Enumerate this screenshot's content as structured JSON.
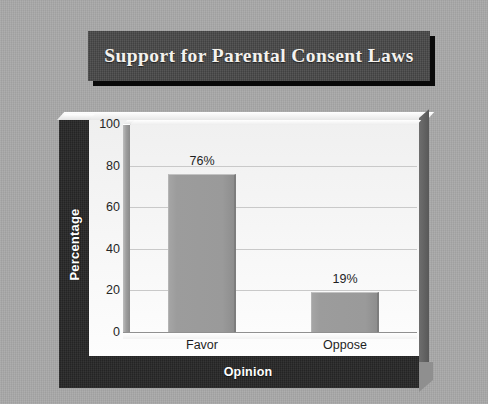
{
  "slide": {
    "title": "Support for Parental Consent Laws",
    "background_color": "#a9a9a9",
    "banner_color": "#474747",
    "banner_text_color": "#f4f2ee"
  },
  "chart_data": {
    "type": "bar",
    "title": "Support for Parental Consent Laws",
    "xlabel": "Opinion",
    "ylabel": "Percentage",
    "categories": [
      "Favor",
      "Oppose"
    ],
    "values": [
      76,
      19
    ],
    "data_labels": [
      "76%",
      "19%"
    ],
    "ylim": [
      0,
      100
    ],
    "yticks": [
      0,
      20,
      40,
      60,
      80,
      100
    ],
    "ytick_labels": [
      "0",
      "20",
      "40",
      "60",
      "80",
      "100"
    ],
    "grid": true,
    "grid_axis": "y",
    "legend": false,
    "legend_position": "none",
    "bar_color": "#9a9a9a",
    "plot_background": "#f5f5f5",
    "axis_band_color": "#262626"
  }
}
